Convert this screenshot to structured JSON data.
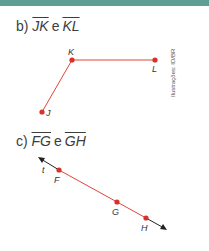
{
  "colors": {
    "topbar": "#5f9e94",
    "segment": "#e0453a",
    "point": "#d9302a",
    "line": "#222222"
  },
  "part_b": {
    "label": "b)",
    "seg1": "JK",
    "connector": "e",
    "seg2": "KL",
    "points": [
      {
        "name": "K",
        "x": 72,
        "y": 60
      },
      {
        "name": "L",
        "x": 155,
        "y": 60
      },
      {
        "name": "J",
        "x": 42,
        "y": 112
      }
    ]
  },
  "part_c": {
    "label": "c)",
    "seg1": "FG",
    "connector": "e",
    "seg2": "GH",
    "line_name": "t",
    "points": [
      {
        "name": "F",
        "x": 59,
        "y": 170
      },
      {
        "name": "G",
        "x": 117,
        "y": 202
      },
      {
        "name": "H",
        "x": 146,
        "y": 218
      }
    ]
  },
  "credit": "Ilustrações: ID/BR"
}
